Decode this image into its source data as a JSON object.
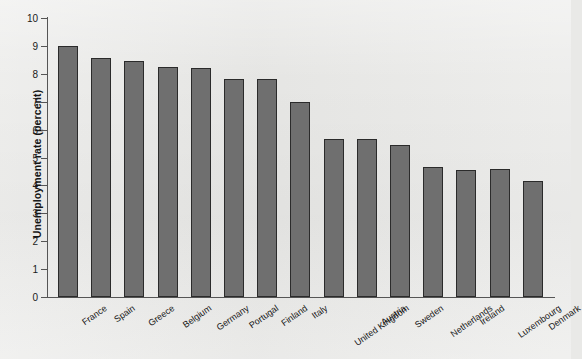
{
  "chart_data": {
    "type": "bar",
    "title": "",
    "xlabel": "",
    "ylabel": "Unemployment rate (percent)",
    "ylim": [
      0,
      10
    ],
    "ytick_labels": [
      "10",
      "9",
      "8",
      "7",
      "6",
      "5",
      "4",
      "3",
      "2",
      "1",
      "0"
    ],
    "ytick_values": [
      10,
      9,
      8,
      7,
      6,
      5,
      4,
      3,
      2,
      1,
      0
    ],
    "grid": false,
    "legend": null,
    "bar_color": "#6f6f6f",
    "bar_edge_color": "#2b2b2b",
    "background_color": "#e9e9e7",
    "categories": [
      "France",
      "Spain",
      "Greece",
      "Belgium",
      "Germany",
      "Portugal",
      "Finland",
      "Italy",
      "United Kingdom",
      "Austria",
      "Sweden",
      "Netherlands",
      "Ireland",
      "Luxembourg",
      "Denmark"
    ],
    "values": [
      9.0,
      8.55,
      8.45,
      8.25,
      8.2,
      7.8,
      7.8,
      7.0,
      5.65,
      5.65,
      5.45,
      4.65,
      4.55,
      4.6,
      4.15
    ]
  }
}
